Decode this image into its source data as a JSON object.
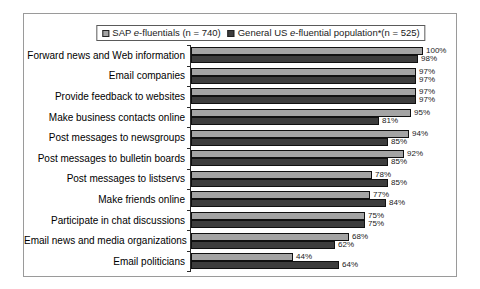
{
  "chart_data": {
    "type": "bar",
    "orientation": "horizontal",
    "title": "",
    "xlabel": "",
    "ylabel": "",
    "xlim": [
      0,
      100
    ],
    "grid": false,
    "legend_position": "top",
    "value_suffix": "%",
    "categories": [
      "Forward news and Web information",
      "Email companies",
      "Provide feedback to websites",
      "Make business contacts online",
      "Post messages to newsgroups",
      "Post messages to bulletin boards",
      "Post messages to listservs",
      "Make friends online",
      "Participate in chat discussions",
      "Email news and media organizations",
      "Email politicians"
    ],
    "series": [
      {
        "name": "SAP e-fluentials (n = 740)",
        "label_parts": [
          {
            "text": "SAP ",
            "italic": false
          },
          {
            "text": "e",
            "italic": true
          },
          {
            "text": "-fluentials (n = 740)",
            "italic": false
          }
        ],
        "color": "#a4a4a4",
        "values": [
          100,
          97,
          97,
          95,
          94,
          92,
          78,
          77,
          75,
          68,
          44
        ]
      },
      {
        "name": "General US e-fluential population*(n = 525)",
        "label_parts": [
          {
            "text": "General US ",
            "italic": false
          },
          {
            "text": "e",
            "italic": true
          },
          {
            "text": "-fluential population*(n = 525)",
            "italic": false
          }
        ],
        "color": "#3d3d3d",
        "values": [
          98,
          97,
          97,
          81,
          85,
          85,
          85,
          84,
          75,
          62,
          64
        ]
      }
    ],
    "colors": {
      "frame_border": "#9a9a9a",
      "axis": "#2a2a2a",
      "bar_outline": "#111111",
      "text": "#1a1a1a"
    }
  }
}
